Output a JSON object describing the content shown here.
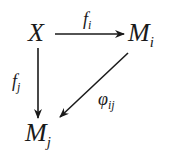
{
  "diagram": {
    "type": "commutative-diagram",
    "nodes": {
      "x": {
        "base": "X",
        "sub": ""
      },
      "mi": {
        "base": "M",
        "sub": "i"
      },
      "mj": {
        "base": "M",
        "sub": "j"
      }
    },
    "arrows": {
      "fi": {
        "from": "X",
        "to": "M_i",
        "base": "f",
        "sub": "i"
      },
      "fj": {
        "from": "X",
        "to": "M_j",
        "base": "f",
        "sub": "j"
      },
      "phi": {
        "from": "M_i",
        "to": "M_j",
        "base": "φ",
        "sub": "ij"
      }
    }
  }
}
